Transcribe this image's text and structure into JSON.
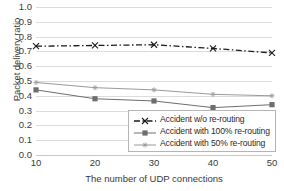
{
  "chart_data": {
    "type": "line",
    "title": "",
    "xlabel": "The number of UDP connections",
    "ylabel": "Packet delivery ratio",
    "x": [
      10,
      20,
      30,
      40,
      50
    ],
    "xlim": [
      10,
      50
    ],
    "ylim": [
      0.0,
      1.0
    ],
    "grid": "horizontal",
    "legend_position": "inside-lower-right",
    "xticks": [
      "10",
      "20",
      "30",
      "40",
      "50"
    ],
    "yticks": [
      "0.0",
      "0.1",
      "0.2",
      "0.3",
      "0.4",
      "0.5",
      "0.6",
      "0.7",
      "0.8",
      "0.9",
      "1.0"
    ],
    "ytick_values": [
      0.0,
      0.1,
      0.2,
      0.3,
      0.4,
      0.5,
      0.6,
      0.7,
      0.8,
      0.9,
      1.0
    ],
    "series": [
      {
        "name": "Accident w/o re-routing",
        "values": [
          0.735,
          0.74,
          0.745,
          0.72,
          0.69
        ],
        "marker": "x-mark",
        "line_style": "dash-dot",
        "color": "#1a1a1a"
      },
      {
        "name": "Accident with 100% re-routing",
        "values": [
          0.44,
          0.38,
          0.365,
          0.32,
          0.34
        ],
        "marker": "filled-square",
        "line_style": "solid",
        "color": "#6e6e6e"
      },
      {
        "name": "Accident with 50% re-routing",
        "values": [
          0.49,
          0.455,
          0.44,
          0.41,
          0.4
        ],
        "marker": "small-cross",
        "line_style": "solid",
        "color": "#9a9a9a"
      }
    ]
  },
  "axes": {
    "y_title": "Packet delivery ratio",
    "x_title": "The number of UDP connections",
    "y_labels": [
      "1.0",
      "0.9",
      "0.8",
      "0.7",
      "0.6",
      "0.5",
      "0.4",
      "0.3",
      "0.2",
      "0.1",
      "0.0"
    ],
    "x_labels": [
      "10",
      "20",
      "30",
      "40",
      "50"
    ]
  },
  "legend": {
    "items": [
      {
        "label": "Accident w/o re-routing"
      },
      {
        "label": "Accident with 100% re-routing"
      },
      {
        "label": "Accident with 50% re-routing"
      }
    ]
  },
  "colors": {
    "series_1": "#1a1a1a",
    "series_2": "#6e6e6e",
    "series_3": "#9a9a9a",
    "gridline": "#dcdcdc",
    "text": "#3a3a3a",
    "background": "#ffffff"
  }
}
